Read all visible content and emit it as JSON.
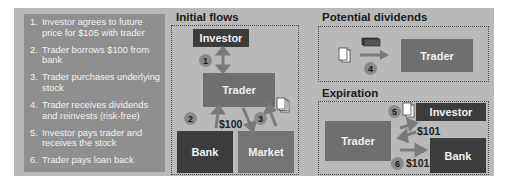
{
  "steps": [
    {
      "num": "1.",
      "text": "Investor agrees to future price for $105 with trader"
    },
    {
      "num": "2.",
      "text": "Trader borrows $100 from bank"
    },
    {
      "num": "3.",
      "text": "Trader purchases underlying stock"
    },
    {
      "num": "4.",
      "text": "Trader receives dividends and reinvests (risk-free)"
    },
    {
      "num": "5.",
      "text": "Investor pays trader and receives the stock"
    },
    {
      "num": "6.",
      "text": "Trader pays loan back"
    }
  ],
  "initial_flows": {
    "title": "Initial flows",
    "investor": "Investor",
    "trader": "Trader",
    "bank": "Bank",
    "market": "Market",
    "badge1": "1",
    "badge2": "2",
    "badge3": "3",
    "amount": "$100"
  },
  "potential_dividends": {
    "title": "Potential dividends",
    "trader": "Trader",
    "badge4": "4"
  },
  "expiration": {
    "title": "Expiration",
    "trader": "Trader",
    "investor": "Investor",
    "bank": "Bank",
    "badge5": "5",
    "badge6": "6",
    "amount_investor": "$101",
    "amount_bank": "$101"
  }
}
